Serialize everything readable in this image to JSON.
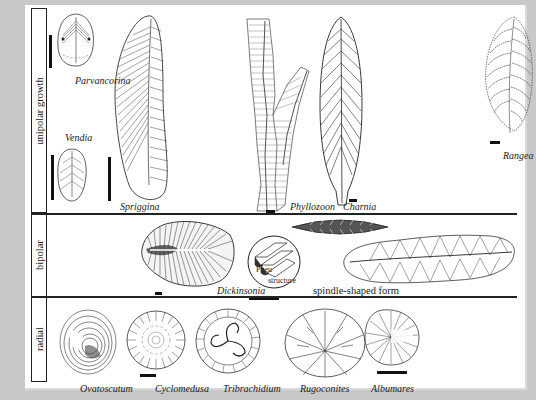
{
  "figure": {
    "rows": [
      {
        "id": "unipolar",
        "label": "unipolar growth"
      },
      {
        "id": "bipolar",
        "label": "bipolar"
      },
      {
        "id": "radial",
        "label": "radial"
      }
    ],
    "taxa": {
      "parvancorina": "Parvancorina",
      "vendia": "Vendia",
      "spriggina": "Spriggina",
      "phyllozoon": "Phyllozoon",
      "charnia": "Charnia",
      "rangea": "Rangea",
      "dickinsonia": "Dickinsonia",
      "pneu_line1": "Pneu",
      "pneu_line2": "structure",
      "spindle": "spindle-shaped form",
      "ovatoscutum": "Ovatoscutum",
      "cyclomedusa": "Cyclomedusa",
      "tribrachidium": "Tribrachidium",
      "rugoconites": "Rugoconites",
      "albumares": "Albumares"
    },
    "colors": {
      "background": "#c8c8c8",
      "panel": "#ffffff",
      "ink": "#222222"
    }
  }
}
